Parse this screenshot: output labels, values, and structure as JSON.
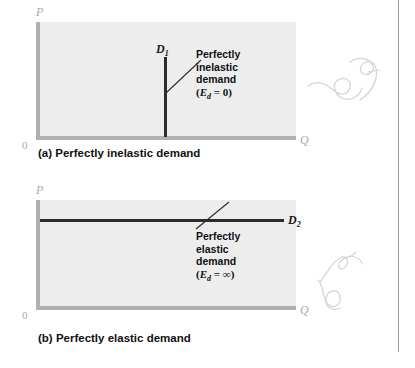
{
  "figure": {
    "panels": [
      {
        "id": "a",
        "caption": "(a) Perfectly inelastic demand",
        "axis_y_label": "P",
        "axis_x_label": "Q",
        "origin_label": "0",
        "curve_label_letter": "D",
        "curve_label_subscript": "1",
        "annotation_line_1": "Perfectly",
        "annotation_line_2": "inelastic",
        "annotation_line_3": "demand",
        "elasticity_open_paren": "(",
        "elasticity_symbol": "E",
        "elasticity_subscript": "d",
        "elasticity_equals": " = ",
        "elasticity_value": "0",
        "elasticity_close_paren": ")",
        "curve_orientation": "vertical"
      },
      {
        "id": "b",
        "caption": "(b) Perfectly elastic demand",
        "axis_y_label": "P",
        "axis_x_label": "Q",
        "origin_label": "0",
        "curve_label_letter": "D",
        "curve_label_subscript": "2",
        "annotation_line_1": "Perfectly",
        "annotation_line_2": "elastic",
        "annotation_line_3": "demand",
        "elasticity_open_paren": "(",
        "elasticity_symbol": "E",
        "elasticity_subscript": "d",
        "elasticity_equals": " = ",
        "elasticity_value": "∞",
        "elasticity_close_paren": ")",
        "curve_orientation": "horizontal"
      }
    ],
    "colors": {
      "plot_background": "#ededed",
      "axis": "#b0b0b0",
      "curve": "#2b2b2b",
      "text": "#111111",
      "axis_label": "#a8a8a8",
      "page_edge": "#9b9b9b",
      "handwriting": "#d5d5d8"
    },
    "marginalia": [
      {
        "name": "handwritten-note-top"
      },
      {
        "name": "handwritten-note-bottom"
      }
    ]
  }
}
